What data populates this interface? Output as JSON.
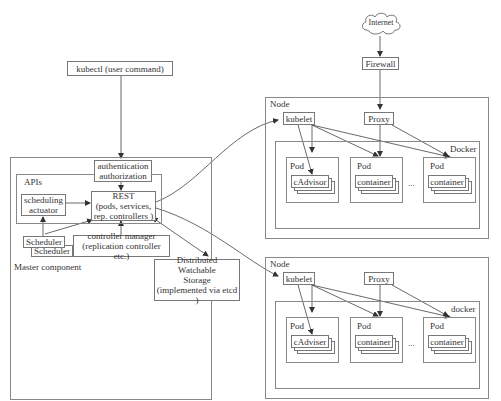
{
  "diagram": {
    "external": {
      "internet": "Internet",
      "firewall": "Firewall",
      "kubectl": "kubectl (user command)"
    },
    "master": {
      "label": "Master component",
      "apis_label": "APIs",
      "auth_line1": "authentication",
      "auth_line2": "authorization",
      "rest_line1": "REST",
      "rest_line2": "(pods, services,",
      "rest_line3": "rep. controllers )",
      "sched_act_line1": "scheduling",
      "sched_act_line2": "actuator",
      "scheduler_front": "Scheduler",
      "scheduler_back": "Scheduler",
      "ctrl_line1": "controller manager",
      "ctrl_line2": "(replication controller etc.)"
    },
    "storage": {
      "line1": "Distributed",
      "line2": "Watchable",
      "line3": "Storage",
      "line4": "(implemented via etcd )"
    },
    "nodes": [
      {
        "label": "Node",
        "kubelet": "kubelet",
        "proxy": "Proxy",
        "runtime": "Docker",
        "pods": [
          {
            "label": "Pod",
            "container": "cAdvisor"
          },
          {
            "label": "Pod",
            "container": "container"
          },
          {
            "label": "Pod",
            "container": "container"
          }
        ],
        "ellipsis": "..."
      },
      {
        "label": "Node",
        "kubelet": "kubelet",
        "proxy": "Proxy",
        "runtime": "docker",
        "pods": [
          {
            "label": "Pod",
            "container": "cAdviser"
          },
          {
            "label": "Pod",
            "container": "container"
          },
          {
            "label": "Pod",
            "container": "container"
          }
        ],
        "ellipsis": "..."
      }
    ]
  }
}
